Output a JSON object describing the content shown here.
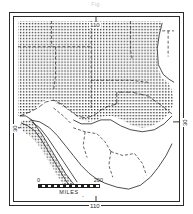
{
  "figure": {
    "caption_fragment": "Fig."
  },
  "graticule": {
    "top_label": "110",
    "bottom_label": "110",
    "left_label": "30",
    "right_label": "30"
  },
  "scale": {
    "min_label": "0",
    "max_label": "200",
    "units_label": "MILES"
  },
  "legend": {
    "shaded_meaning": "stippled distribution area",
    "unshaded_meaning": "area outside distribution"
  },
  "colors": {
    "ink": "#1f1f1f",
    "frame": "#2b2b2b",
    "paper": "#ffffff",
    "stipple": "#3a3a3a",
    "caption": "#c9c9c9"
  },
  "map_content": {
    "projection_note": "plain rectangular graticule",
    "shaded_regions": [
      "northern Mexico interior",
      "Baja California peninsula",
      "southwestern United States"
    ],
    "unshaded_regions": [
      "Gulf of California",
      "central and southern Mexico",
      "eastern Texas",
      "Gulf of Mexico"
    ],
    "boundary_style": "dashed internal state boundaries, solid coastlines"
  }
}
